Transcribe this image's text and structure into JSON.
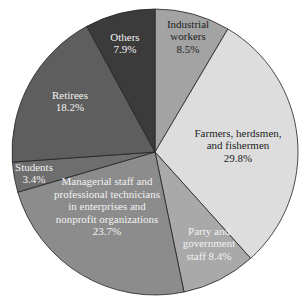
{
  "chart_data": {
    "type": "pie",
    "title": "",
    "start_angle_deg": 0,
    "direction": "clockwise",
    "slices": [
      {
        "label": "Industrial workers",
        "value": 8.5,
        "display": "8.5%",
        "color": "#a3a3a3",
        "text_color": "#1e1e1e",
        "lines": [
          "Industrial",
          "workers",
          "8.5%"
        ],
        "lx": 188,
        "ly": 36
      },
      {
        "label": "Farmers, herdsmen, and fishermen",
        "value": 29.8,
        "display": "29.8%",
        "color": "#dddddd",
        "text_color": "#1e1e1e",
        "lines": [
          "Farmers, herdsmen,",
          "and fishermen",
          "29.8%"
        ],
        "lx": 238,
        "ly": 145
      },
      {
        "label": "Party and government staff",
        "value": 8.4,
        "display": "8.4%",
        "color": "#a9a9a9",
        "text_color": "#f2f2f2",
        "lines": [
          "Party and",
          "government",
          "staff 8.4%"
        ],
        "lx": 209,
        "ly": 243
      },
      {
        "label": "Managerial staff and professional technicians in enterprises and nonprofit organizations",
        "value": 23.7,
        "display": "23.7%",
        "color": "#8c8c8c",
        "text_color": "#f2f2f2",
        "lines": [
          "Managerial staff and",
          "professional technicians",
          "in enterprises and",
          "nonprofit organizations",
          "23.7%"
        ],
        "lx": 107,
        "ly": 206
      },
      {
        "label": "Students",
        "value": 3.4,
        "display": "3.4%",
        "color": "#6e6e6e",
        "text_color": "#f2f2f2",
        "lines": [
          "Students",
          "3.4%"
        ],
        "lx": 34,
        "ly": 173
      },
      {
        "label": "Retirees",
        "value": 18.2,
        "display": "18.2%",
        "color": "#5e5e5e",
        "text_color": "#f2f2f2",
        "lines": [
          "Retirees",
          "18.2%"
        ],
        "lx": 70,
        "ly": 101
      },
      {
        "label": "Others",
        "value": 7.9,
        "display": "7.9%",
        "color": "#3b3b3b",
        "text_color": "#f2f2f2",
        "lines": [
          "Others",
          "7.9%"
        ],
        "lx": 125,
        "ly": 43
      }
    ],
    "legend": "none (inline labels)"
  }
}
